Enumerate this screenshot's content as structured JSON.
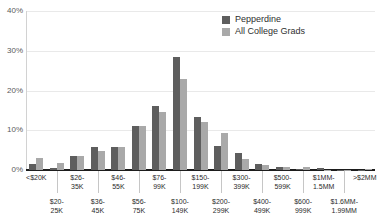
{
  "chart_data": {
    "type": "bar",
    "title": "",
    "xlabel": "",
    "ylabel": "",
    "ylim": [
      0,
      40
    ],
    "yticks": [
      "0%",
      "10%",
      "20%",
      "30%",
      "40%"
    ],
    "ytick_values": [
      0,
      10,
      20,
      30,
      40
    ],
    "grid": true,
    "legend_position": "top-right",
    "categories": [
      "<$20K",
      "$20-25K",
      "$26-35K",
      "$36-45K",
      "$46-55K",
      "$56-75K",
      "$76-99K",
      "$100-149K",
      "$150-199K",
      "$200-299K",
      "$300-399K",
      "$400-499K",
      "$500-599K",
      "$600-999K",
      "$1MM-1.5MM",
      "$1.6MM-1.99MM",
      ">$2MM"
    ],
    "category_labels": [
      "<$20K",
      "$20-\n25K",
      "$26-\n35K",
      "$36-\n45K",
      "$46-\n55K",
      "$56-\n75K",
      "$76-\n99K",
      "$100-\n149K",
      "$150-\n199K",
      "$200-\n299K",
      "$300-\n399K",
      "$400-\n499K",
      "$500-\n599K",
      "$600-\n999K",
      "$1MM-\n1.5MM",
      "$1.6MM-\n1.99MM",
      ">$2MM"
    ],
    "series": [
      {
        "name": "Pepperdine",
        "color": "#5e5e5e",
        "values": [
          1.4,
          0.6,
          3.6,
          5.8,
          5.9,
          11.0,
          16.2,
          28.4,
          13.3,
          6.0,
          4.3,
          1.5,
          0.7,
          0.2,
          0.5,
          0.1,
          0.1
        ]
      },
      {
        "name": "All College Grads",
        "color": "#a9a9a9",
        "values": [
          2.9,
          1.7,
          3.5,
          4.8,
          5.9,
          11.1,
          14.6,
          22.9,
          12.2,
          9.4,
          2.8,
          1.2,
          0.8,
          0.7,
          0.1,
          0.1,
          0.2
        ]
      }
    ]
  },
  "legend": {
    "items": [
      {
        "label": "Pepperdine"
      },
      {
        "label": "All College Grads"
      }
    ]
  }
}
